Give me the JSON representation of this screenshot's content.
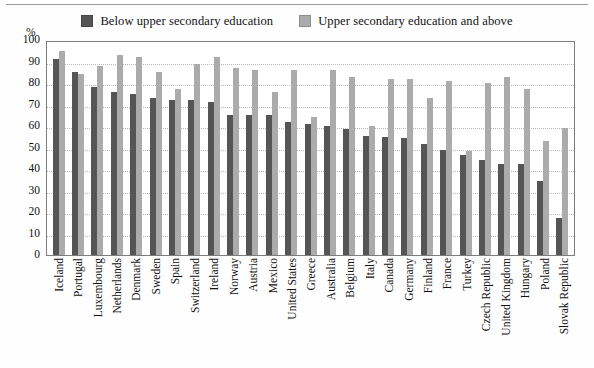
{
  "legend": {
    "items": [
      {
        "label": "Below upper secondary education",
        "color": "#555555",
        "key": "below"
      },
      {
        "label": "Upper secondary education and above",
        "color": "#ababab",
        "key": "upper"
      }
    ]
  },
  "axis": {
    "unit_label": "%",
    "y_ticks": [
      "100",
      "90",
      "80",
      "70",
      "60",
      "50",
      "40",
      "30",
      "20",
      "10",
      "0"
    ]
  },
  "chart_data": {
    "type": "bar",
    "title": "",
    "xlabel": "",
    "ylabel": "%",
    "ylim": [
      0,
      100
    ],
    "ytick_step": 10,
    "grid": true,
    "legend_position": "top-center",
    "orientation": "vertical",
    "grouping": "grouped",
    "categories": [
      "Iceland",
      "Portugal",
      "Luxembourg",
      "Netherlands",
      "Denmark",
      "Sweden",
      "Spain",
      "Switzerland",
      "Ireland",
      "Norway",
      "Austria",
      "Mexico",
      "United States",
      "Greece",
      "Australia",
      "Belgium",
      "Italy",
      "Canada",
      "Germany",
      "Finland",
      "France",
      "Turkey",
      "Czech Republic",
      "United Kingdom",
      "Hungary",
      "Poland",
      "Slovak Republic"
    ],
    "series": [
      {
        "name": "Below upper secondary education",
        "color": "#555555",
        "values": [
          91,
          85,
          78,
          76,
          75,
          73,
          72,
          72,
          71,
          65,
          65,
          65,
          62,
          61,
          60,
          58.5,
          55.5,
          55,
          54.5,
          51.5,
          49,
          46.5,
          44,
          42.5,
          42.5,
          34.5,
          17
        ]
      },
      {
        "name": "Upper secondary education and above",
        "color": "#ababab",
        "values": [
          95,
          84,
          88,
          93,
          92,
          85,
          77,
          89,
          92,
          87,
          86,
          76,
          86,
          64,
          86,
          83,
          60,
          82,
          82,
          73,
          81,
          48.5,
          80,
          83,
          77,
          53,
          59
        ]
      }
    ]
  }
}
